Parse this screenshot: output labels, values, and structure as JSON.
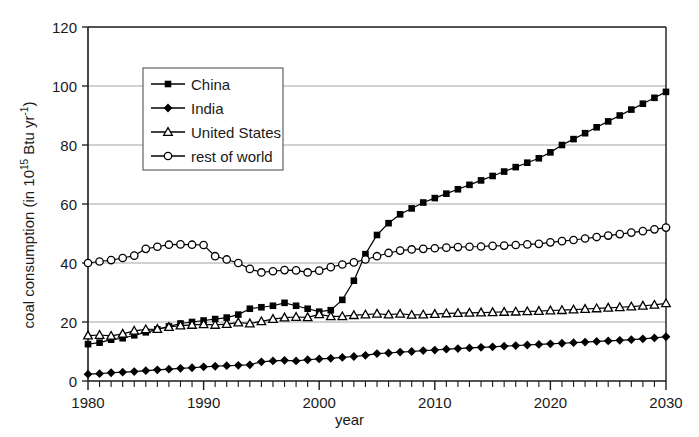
{
  "chart_data": {
    "type": "line",
    "title": "",
    "xlabel": "year",
    "ylabel_plain": "coal consumption (in 10^15 Btu yr^-1)",
    "ylabel_prefix": "coal consumption (in 10",
    "ylabel_exp1": "15",
    "ylabel_mid": " Btu yr",
    "ylabel_exp2": "-1",
    "ylabel_suffix": ")",
    "xlim": [
      1980,
      2030
    ],
    "ylim": [
      0,
      120
    ],
    "xticks": [
      1980,
      1990,
      2000,
      2010,
      2020,
      2030
    ],
    "xtick_labels": [
      "1980",
      "1990",
      "2000",
      "2010",
      "2020",
      "2030"
    ],
    "xminor_step": 1,
    "yticks": [
      0,
      20,
      40,
      60,
      80,
      100,
      120
    ],
    "ytick_labels": [
      "0",
      "20",
      "40",
      "60",
      "80",
      "100",
      "120"
    ],
    "grid": "horizontal",
    "grid_color": "#999999",
    "axis_color": "#1a1a1a",
    "series_color": "#000000",
    "legend_position": "upper-left-inside",
    "x": [
      1980,
      1981,
      1982,
      1983,
      1984,
      1985,
      1986,
      1987,
      1988,
      1989,
      1990,
      1991,
      1992,
      1993,
      1994,
      1995,
      1996,
      1997,
      1998,
      1999,
      2000,
      2001,
      2002,
      2003,
      2004,
      2005,
      2006,
      2007,
      2008,
      2009,
      2010,
      2011,
      2012,
      2013,
      2014,
      2015,
      2016,
      2017,
      2018,
      2019,
      2020,
      2021,
      2022,
      2023,
      2024,
      2025,
      2026,
      2027,
      2028,
      2029,
      2030
    ],
    "series": [
      {
        "name": "China",
        "marker": "filled-square",
        "values": [
          12.5,
          13.0,
          14.0,
          14.5,
          15.5,
          16.5,
          17.5,
          18.5,
          19.5,
          20.0,
          20.5,
          21.0,
          21.5,
          22.5,
          24.5,
          25.0,
          25.5,
          26.5,
          25.5,
          24.5,
          23.5,
          24.0,
          27.5,
          34.0,
          43.0,
          49.5,
          53.5,
          56.5,
          58.5,
          60.5,
          62.0,
          63.5,
          65.0,
          66.5,
          68.0,
          69.5,
          71.0,
          72.5,
          74.0,
          75.5,
          77.5,
          80.0,
          82.0,
          84.0,
          86.0,
          88.0,
          90.0,
          92.0,
          94.0,
          96.0,
          98.0
        ]
      },
      {
        "name": "India",
        "marker": "filled-diamond",
        "values": [
          2.3,
          2.5,
          2.8,
          3.0,
          3.2,
          3.5,
          3.8,
          4.0,
          4.3,
          4.5,
          4.8,
          5.0,
          5.2,
          5.3,
          5.5,
          6.5,
          6.8,
          7.0,
          6.8,
          7.2,
          7.5,
          7.7,
          8.0,
          8.3,
          8.7,
          9.3,
          9.5,
          9.8,
          10.0,
          10.3,
          10.5,
          10.8,
          11.0,
          11.2,
          11.4,
          11.6,
          11.8,
          12.0,
          12.2,
          12.4,
          12.6,
          12.8,
          13.0,
          13.2,
          13.4,
          13.6,
          13.8,
          14.0,
          14.3,
          14.6,
          15.0
        ]
      },
      {
        "name": "United States",
        "marker": "open-triangle",
        "values": [
          15.4,
          15.6,
          15.3,
          16.0,
          17.0,
          17.5,
          17.6,
          18.3,
          18.8,
          19.0,
          19.2,
          19.0,
          19.3,
          19.8,
          19.5,
          20.2,
          21.0,
          21.5,
          21.7,
          21.6,
          22.6,
          21.9,
          21.9,
          22.3,
          22.5,
          22.8,
          22.5,
          22.8,
          22.4,
          22.5,
          22.7,
          22.9,
          23.0,
          23.1,
          23.2,
          23.3,
          23.4,
          23.5,
          23.6,
          23.7,
          23.9,
          24.0,
          24.2,
          24.4,
          24.6,
          24.8,
          25.0,
          25.2,
          25.5,
          25.8,
          26.3
        ]
      },
      {
        "name": "rest of world",
        "marker": "open-circle",
        "values": [
          40.0,
          40.5,
          41.0,
          41.7,
          42.5,
          44.8,
          45.5,
          46.2,
          46.3,
          46.2,
          46.1,
          42.3,
          41.2,
          40.0,
          38.0,
          36.8,
          37.2,
          37.6,
          37.5,
          36.8,
          37.4,
          38.6,
          39.5,
          40.2,
          41.2,
          42.3,
          43.4,
          44.2,
          44.6,
          44.8,
          45.0,
          45.2,
          45.4,
          45.5,
          45.6,
          45.8,
          45.9,
          46.1,
          46.3,
          46.5,
          47.0,
          47.4,
          47.8,
          48.3,
          48.8,
          49.3,
          49.8,
          50.3,
          50.8,
          51.4,
          52.0
        ]
      }
    ]
  },
  "legend": {
    "entries": [
      "China",
      "India",
      "United States",
      "rest of world"
    ]
  }
}
